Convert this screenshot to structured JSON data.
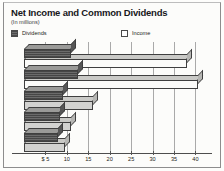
{
  "header": {
    "title": "Net Income and Common Dividends",
    "subtitle": "(In millions)"
  },
  "legend": {
    "dividends_label": "Dividends",
    "income_label": "Income",
    "dividends_swatch": "dark-hatched-square-icon",
    "income_swatch": "white-square-icon"
  },
  "chart_data": {
    "type": "bar",
    "orientation": "horizontal",
    "title": "Net Income and Common Dividends",
    "subtitle": "(In millions)",
    "xlabel": "",
    "ylabel": "",
    "xlim": [
      0,
      42
    ],
    "grid": true,
    "legend_position": "top-left",
    "categories": [
      "Year 1",
      "Year 2",
      "Year 3",
      "Year 4",
      "Year 5"
    ],
    "tick_labels": [
      "$ 5",
      "10",
      "15",
      "20",
      "25",
      "30",
      "35",
      "40"
    ],
    "tick_values": [
      5,
      10,
      15,
      20,
      25,
      30,
      35,
      40
    ],
    "series": [
      {
        "name": "Income",
        "values": [
          38.0,
          40.5,
          16.0,
          11.0,
          9.5
        ]
      },
      {
        "name": "Dividends",
        "values": [
          11.0,
          12.5,
          9.0,
          8.5,
          8.0
        ]
      }
    ]
  },
  "axis": {
    "t0": "$ 5",
    "t1": "10",
    "t2": "15",
    "t3": "20",
    "t4": "25",
    "t5": "30",
    "t6": "35",
    "t7": "40"
  }
}
